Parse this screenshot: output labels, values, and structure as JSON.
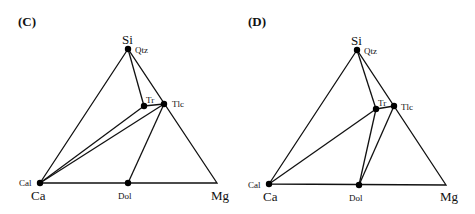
{
  "panels": [
    {
      "label": "(C)",
      "vertices": {
        "top": "Si",
        "left": "Ca",
        "right": "Mg"
      },
      "phases": [
        {
          "name": "Qtz",
          "x": 128,
          "y": 49
        },
        {
          "name": "Tr",
          "x": 144,
          "y": 106
        },
        {
          "name": "Tlc",
          "x": 164,
          "y": 104
        },
        {
          "name": "Cal",
          "x": 40,
          "y": 183
        },
        {
          "name": "Dol",
          "x": 128,
          "y": 183
        }
      ],
      "tie_lines": [
        [
          "Qtz",
          "Tr"
        ],
        [
          "Tr",
          "Tlc"
        ],
        [
          "Cal",
          "Tr"
        ],
        [
          "Cal",
          "Tlc"
        ],
        [
          "Dol",
          "Tlc"
        ]
      ]
    },
    {
      "label": "(D)",
      "vertices": {
        "top": "Si",
        "left": "Ca",
        "right": "Mg"
      },
      "phases": [
        {
          "name": "Qtz",
          "x": 357,
          "y": 50
        },
        {
          "name": "Tr",
          "x": 376,
          "y": 109
        },
        {
          "name": "Tlc",
          "x": 394,
          "y": 106
        },
        {
          "name": "Cal",
          "x": 269,
          "y": 184
        },
        {
          "name": "Dol",
          "x": 359,
          "y": 185
        }
      ],
      "tie_lines": [
        [
          "Qtz",
          "Tr"
        ],
        [
          "Tr",
          "Tlc"
        ],
        [
          "Cal",
          "Tr"
        ],
        [
          "Dol",
          "Tr"
        ],
        [
          "Dol",
          "Tlc"
        ]
      ]
    }
  ]
}
